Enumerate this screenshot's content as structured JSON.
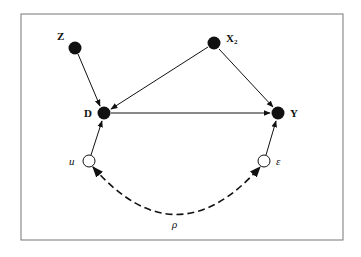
{
  "diagram": {
    "type": "causal-graph",
    "nodes": [
      {
        "id": "Z",
        "label": "Z",
        "sub": "",
        "kind": "observed"
      },
      {
        "id": "X2",
        "label": "X",
        "sub": "2",
        "kind": "observed"
      },
      {
        "id": "D",
        "label": "D",
        "sub": "",
        "kind": "observed"
      },
      {
        "id": "Y",
        "label": "Y",
        "sub": "",
        "kind": "observed"
      },
      {
        "id": "u",
        "label": "u",
        "sub": "",
        "kind": "latent"
      },
      {
        "id": "eps",
        "label": "ε",
        "sub": "",
        "kind": "latent"
      }
    ],
    "edges": [
      {
        "from": "Z",
        "to": "D",
        "style": "solid"
      },
      {
        "from": "X2",
        "to": "D",
        "style": "solid"
      },
      {
        "from": "X2",
        "to": "Y",
        "style": "solid"
      },
      {
        "from": "D",
        "to": "Y",
        "style": "solid"
      },
      {
        "from": "u",
        "to": "D",
        "style": "solid"
      },
      {
        "from": "eps",
        "to": "Y",
        "style": "solid"
      },
      {
        "from": "u",
        "to": "eps",
        "style": "dashed-bidirected",
        "label": "ρ"
      }
    ],
    "correlation_label": "ρ"
  }
}
